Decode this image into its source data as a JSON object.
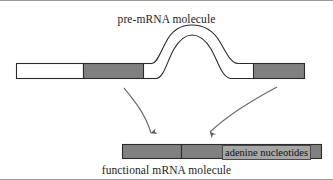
{
  "figure": {
    "caption_top": "pre-mRNA molecule",
    "caption_bottom": "functional mRNA molecule",
    "annotation": "adenine nucleotides",
    "colors": {
      "segment_fill_gray": "#808080",
      "segment_fill_white": "#ffffff",
      "outline": "#2b2b2b",
      "arrow": "#5a5a5a",
      "frame": "#9a9a9a",
      "label_box_fill": "#a6a6a6"
    },
    "diagram_type": "rna-splicing",
    "pre_mrna": {
      "label": "pre-mRNA molecule",
      "segments": [
        {
          "name": "5-prime-untranslated",
          "fill": "white",
          "x": 16,
          "width": 68
        },
        {
          "name": "exon-1-coding",
          "fill": "gray",
          "x": 84,
          "width": 60
        },
        {
          "name": "exon-junction-white",
          "fill": "white",
          "x": 144,
          "width": 110
        },
        {
          "name": "exon-2-coding",
          "fill": "gray",
          "x": 254,
          "width": 51
        }
      ],
      "intron_loop": {
        "name": "intron-loop",
        "present": true,
        "start_x": 150,
        "end_x": 252,
        "apex_y": 27
      }
    },
    "functional_mrna": {
      "label": "functional mRNA molecule",
      "segments": [
        {
          "name": "mrna-coding-1",
          "fill": "gray",
          "x": 122,
          "width": 60
        },
        {
          "name": "mrna-coding-2",
          "fill": "gray",
          "x": 182,
          "width": 140
        }
      ]
    },
    "arrows": [
      {
        "name": "splice-arrow-left",
        "direction": "down",
        "from_x": 124,
        "from_y": 86,
        "to_x": 152,
        "to_y": 140
      },
      {
        "name": "splice-arrow-right",
        "direction": "down-left",
        "from_x": 277,
        "from_y": 86,
        "to_x": 206,
        "to_y": 140
      }
    ]
  }
}
